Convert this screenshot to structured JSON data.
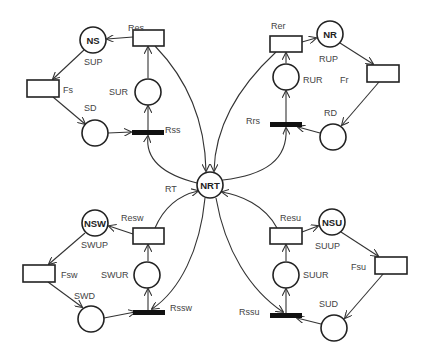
{
  "diagram": {
    "type": "petri-net",
    "center_place": {
      "id": "NRT",
      "label": "NRT",
      "cx": 210,
      "cy": 185
    },
    "quadrants": [
      {
        "name": "top-left",
        "places": [
          {
            "id": "NS",
            "label": "NS",
            "cx": 93,
            "cy": 40
          },
          {
            "id": "SD_place",
            "label": "",
            "cx": 95,
            "cy": 133
          },
          {
            "id": "SUR_place",
            "label": "",
            "cx": 148,
            "cy": 92
          }
        ],
        "transitions": [
          {
            "id": "Res",
            "x": 133,
            "y": 30,
            "w": 31,
            "h": 16
          },
          {
            "id": "Fs",
            "x": 27,
            "y": 80,
            "w": 32,
            "h": 17
          }
        ],
        "bars": [
          {
            "id": "Rss",
            "x": 132,
            "y": 130,
            "w": 32,
            "h": 5
          }
        ],
        "labels": [
          {
            "text": "Res",
            "x": 128,
            "y": 31
          },
          {
            "text": "SUP",
            "x": 84,
            "y": 65
          },
          {
            "text": "Fs",
            "x": 63,
            "y": 93
          },
          {
            "text": "SUR",
            "x": 109,
            "y": 95
          },
          {
            "text": "SD",
            "x": 84,
            "y": 111
          },
          {
            "text": "Rss",
            "x": 165,
            "y": 133
          }
        ]
      },
      {
        "name": "top-right",
        "places": [
          {
            "id": "NR",
            "label": "NR",
            "cx": 330,
            "cy": 34
          },
          {
            "id": "RD_place",
            "label": "",
            "cx": 333,
            "cy": 137
          },
          {
            "id": "RUR_place",
            "label": "",
            "cx": 286,
            "cy": 77
          }
        ],
        "transitions": [
          {
            "id": "Rer",
            "x": 270,
            "y": 36,
            "w": 32,
            "h": 16
          },
          {
            "id": "Fr",
            "x": 367,
            "y": 65,
            "w": 32,
            "h": 17
          }
        ],
        "bars": [
          {
            "id": "Rrs",
            "x": 270,
            "y": 122,
            "w": 32,
            "h": 5
          }
        ],
        "labels": [
          {
            "text": "Rer",
            "x": 271,
            "y": 29
          },
          {
            "text": "RUP",
            "x": 319,
            "y": 62
          },
          {
            "text": "RUR",
            "x": 303,
            "y": 83
          },
          {
            "text": "Fr",
            "x": 340,
            "y": 83
          },
          {
            "text": "RD",
            "x": 324,
            "y": 116
          },
          {
            "text": "Rrs",
            "x": 246,
            "y": 124
          }
        ]
      },
      {
        "name": "bottom-left",
        "places": [
          {
            "id": "NSW",
            "label": "NSW",
            "cx": 95,
            "cy": 223
          },
          {
            "id": "SWD_place",
            "label": "",
            "cx": 91,
            "cy": 319
          },
          {
            "id": "SWUR_place",
            "label": "",
            "cx": 147,
            "cy": 275
          }
        ],
        "transitions": [
          {
            "id": "Resw",
            "x": 133,
            "y": 228,
            "w": 31,
            "h": 16
          },
          {
            "id": "Fsw",
            "x": 23,
            "y": 265,
            "w": 32,
            "h": 17
          }
        ],
        "bars": [
          {
            "id": "Rssw",
            "x": 133,
            "y": 310,
            "w": 32,
            "h": 5
          }
        ],
        "labels": [
          {
            "text": "Resw",
            "x": 121,
            "y": 221
          },
          {
            "text": "SWUP",
            "x": 81,
            "y": 248
          },
          {
            "text": "Fsw",
            "x": 61,
            "y": 278
          },
          {
            "text": "SWUR",
            "x": 101,
            "y": 278
          },
          {
            "text": "SWD",
            "x": 74,
            "y": 299
          },
          {
            "text": "Rssw",
            "x": 170,
            "y": 311
          }
        ]
      },
      {
        "name": "bottom-right",
        "places": [
          {
            "id": "NSU",
            "label": "NSU",
            "cx": 332,
            "cy": 222
          },
          {
            "id": "SUD_place",
            "label": "",
            "cx": 334,
            "cy": 328
          },
          {
            "id": "SUUR_place",
            "label": "",
            "cx": 286,
            "cy": 275
          }
        ],
        "transitions": [
          {
            "id": "Resu",
            "x": 270,
            "y": 228,
            "w": 32,
            "h": 16
          },
          {
            "id": "Fsu",
            "x": 375,
            "y": 257,
            "w": 32,
            "h": 17
          }
        ],
        "bars": [
          {
            "id": "Rssu",
            "x": 270,
            "y": 313,
            "w": 32,
            "h": 5
          }
        ],
        "labels": [
          {
            "text": "Resu",
            "x": 280,
            "y": 221
          },
          {
            "text": "SUUP",
            "x": 315,
            "y": 249
          },
          {
            "text": "Fsu",
            "x": 351,
            "y": 270
          },
          {
            "text": "SUUR",
            "x": 303,
            "y": 278
          },
          {
            "text": "SUD",
            "x": 319,
            "y": 307
          },
          {
            "text": "Rssu",
            "x": 239,
            "y": 315
          }
        ]
      }
    ],
    "center_labels": [
      {
        "text": "RT",
        "x": 165,
        "y": 192
      }
    ],
    "arcs": [
      {
        "d": "M133,37 L107,39"
      },
      {
        "d": "M84,50 L53,79"
      },
      {
        "d": "M53,97 L85,124"
      },
      {
        "d": "M108,133 L131,132"
      },
      {
        "d": "M148,130 L148,106"
      },
      {
        "d": "M148,78 L148,47"
      },
      {
        "d": "M155,46 C188,80 205,120 206,171"
      },
      {
        "d": "M197,183 C165,175 145,160 148,136"
      },
      {
        "d": "M302,42 L316,38"
      },
      {
        "d": "M340,43 L373,64"
      },
      {
        "d": "M379,82 L342,125"
      },
      {
        "d": "M320,133 L298,127"
      },
      {
        "d": "M286,122 L286,91"
      },
      {
        "d": "M286,63 L286,53"
      },
      {
        "d": "M276,52 C235,90 215,130 214,171"
      },
      {
        "d": "M223,180 C265,175 288,160 286,128"
      },
      {
        "d": "M133,234 L109,226"
      },
      {
        "d": "M85,233 L49,264"
      },
      {
        "d": "M48,282 L82,307"
      },
      {
        "d": "M104,318 L135,312"
      },
      {
        "d": "M148,310 L148,289"
      },
      {
        "d": "M148,261 L148,245"
      },
      {
        "d": "M155,228 C165,205 180,195 198,191"
      },
      {
        "d": "M205,198 C200,250 180,290 152,309"
      },
      {
        "d": "M302,232 L318,226"
      },
      {
        "d": "M341,232 L378,256"
      },
      {
        "d": "M384,273 L345,318"
      },
      {
        "d": "M321,324 L297,318"
      },
      {
        "d": "M286,313 L286,289"
      },
      {
        "d": "M286,261 L286,245"
      },
      {
        "d": "M277,228 C265,205 240,195 222,192"
      },
      {
        "d": "M216,198 C225,250 250,290 283,312"
      }
    ]
  }
}
